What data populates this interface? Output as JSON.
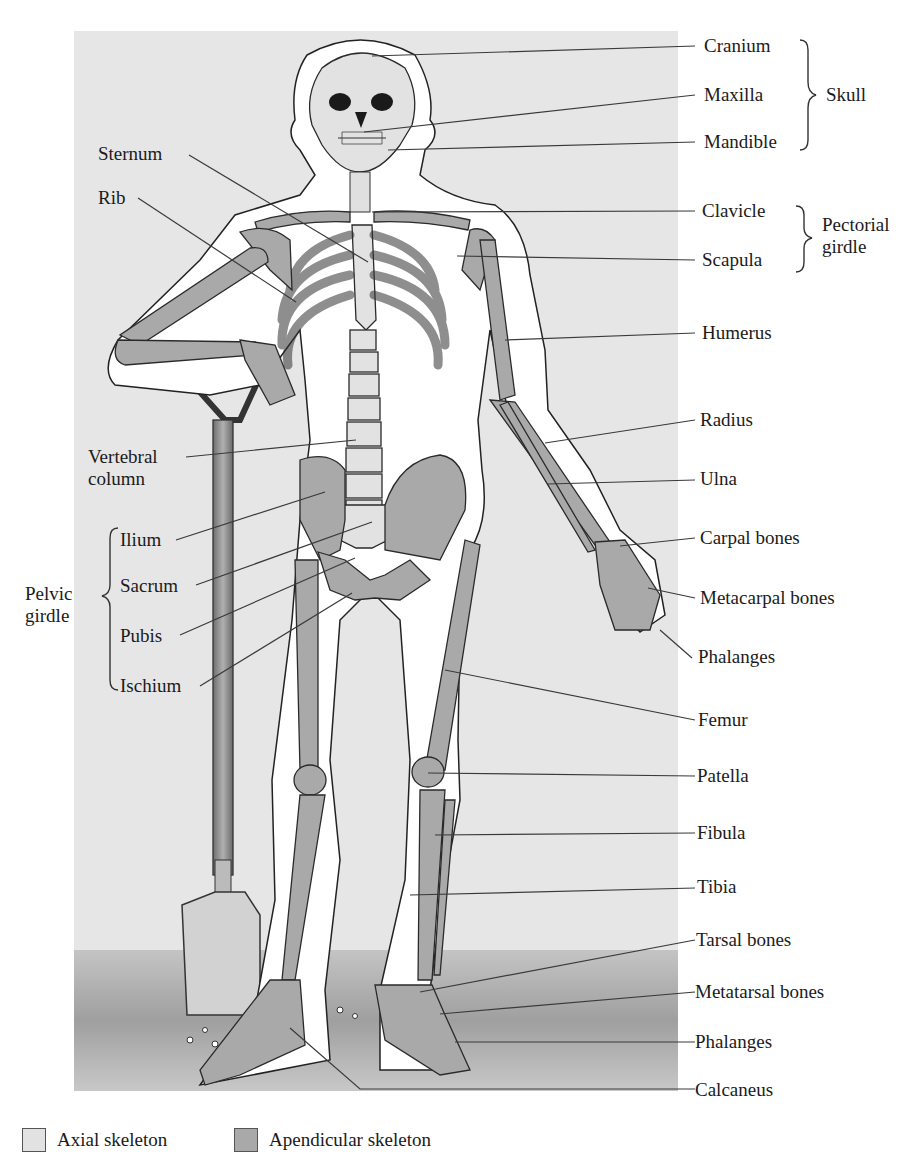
{
  "figure": {
    "panel_color": "#e6e6e6",
    "ground_color": "#bdbdbd",
    "axial_color": "#e2e2e2",
    "appendicular_color": "#a9a9a9"
  },
  "labels_right": [
    {
      "id": "cranium",
      "text": "Cranium"
    },
    {
      "id": "maxilla",
      "text": "Maxilla"
    },
    {
      "id": "mandible",
      "text": "Mandible"
    },
    {
      "id": "clavicle",
      "text": "Clavicle"
    },
    {
      "id": "scapula",
      "text": "Scapula"
    },
    {
      "id": "humerus",
      "text": "Humerus"
    },
    {
      "id": "radius",
      "text": "Radius"
    },
    {
      "id": "ulna",
      "text": "Ulna"
    },
    {
      "id": "carpal",
      "text": "Carpal bones"
    },
    {
      "id": "metacarpal",
      "text": "Metacarpal bones"
    },
    {
      "id": "phalanges_hand",
      "text": "Phalanges"
    },
    {
      "id": "femur",
      "text": "Femur"
    },
    {
      "id": "patella",
      "text": "Patella"
    },
    {
      "id": "fibula",
      "text": "Fibula"
    },
    {
      "id": "tibia",
      "text": "Tibia"
    },
    {
      "id": "tarsal",
      "text": "Tarsal bones"
    },
    {
      "id": "metatarsal",
      "text": "Metatarsal bones"
    },
    {
      "id": "phalanges_foot",
      "text": "Phalanges"
    },
    {
      "id": "calcaneus",
      "text": "Calcaneus"
    }
  ],
  "labels_left": [
    {
      "id": "sternum",
      "text": "Sternum"
    },
    {
      "id": "rib",
      "text": "Rib"
    },
    {
      "id": "vertebral",
      "text": "Vertebral column"
    },
    {
      "id": "ilium",
      "text": "Ilium"
    },
    {
      "id": "sacrum",
      "text": "Sacrum"
    },
    {
      "id": "pubis",
      "text": "Pubis"
    },
    {
      "id": "ischium",
      "text": "Ischium"
    }
  ],
  "groups": {
    "skull": "Skull",
    "pectoral": "Pectorial girdle",
    "pelvic": "Pelvic girdle"
  },
  "legend": [
    {
      "label": "Axial skeleton",
      "color": "#e2e2e2"
    },
    {
      "label": "Apendicular skeleton",
      "color": "#a9a9a9"
    }
  ]
}
